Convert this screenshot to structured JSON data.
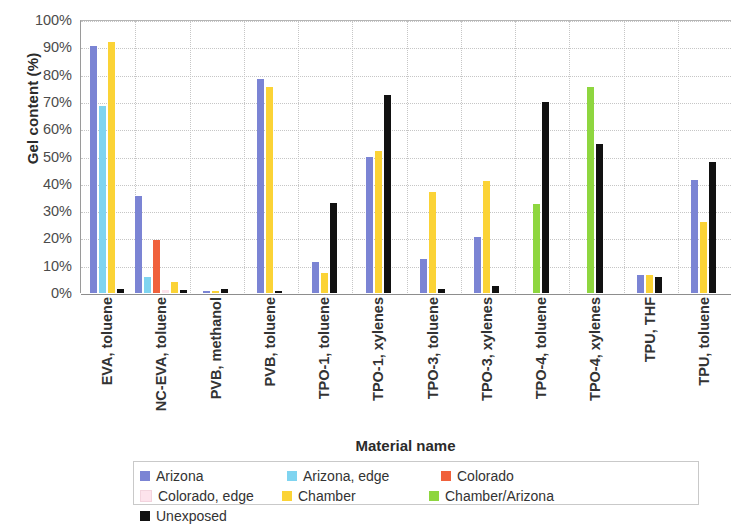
{
  "chart_data": {
    "type": "bar",
    "title": "",
    "xlabel": "Material name",
    "ylabel": "Gel content (%)",
    "ylim": [
      0,
      100
    ],
    "ytick_labels": [
      "100%",
      "90%",
      "80%",
      "70%",
      "60%",
      "50%",
      "40%",
      "30%",
      "20%",
      "10%",
      "0%"
    ],
    "ytick_values": [
      100,
      90,
      80,
      70,
      60,
      50,
      40,
      30,
      20,
      10,
      0
    ],
    "grid": true,
    "legend_position": "bottom",
    "categories": [
      "EVA, toluene",
      "NC-EVA, toluene",
      "PVB, methanol",
      "PVB, toluene",
      "TPO-1, toluene",
      "TPO-1, xylenes",
      "TPO-3, toluene",
      "TPO-3, xylenes",
      "TPO-4, toluene",
      "TPO-4, xylenes",
      "TPU, THF",
      "TPU, toluene"
    ],
    "series": [
      {
        "name": "Arizona",
        "color": "#7b84d4",
        "values": [
          90.5,
          35.5,
          0.8,
          78.5,
          11.5,
          50,
          12.5,
          20.5,
          0,
          0,
          6.5,
          41.5
        ]
      },
      {
        "name": "Arizona, edge",
        "color": "#7fd4f0",
        "values": [
          68.5,
          6,
          0,
          0,
          0,
          0,
          0,
          0,
          0,
          0,
          0,
          0
        ]
      },
      {
        "name": "Colorado",
        "color": "#f0613c",
        "values": [
          0,
          19.5,
          0,
          0,
          0,
          0,
          0,
          0,
          0,
          0,
          0,
          0
        ]
      },
      {
        "name": "Colorado, edge",
        "color": "#fde3ec",
        "values": [
          0,
          1.2,
          0,
          0,
          0,
          0,
          0,
          0,
          0,
          0,
          0,
          0
        ]
      },
      {
        "name": "Chamber",
        "color": "#fbd336",
        "values": [
          92,
          4,
          0.6,
          75.5,
          7.5,
          52,
          37,
          41,
          0,
          0,
          6.5,
          26
        ]
      },
      {
        "name": "Chamber/Arizona",
        "color": "#8ed63f",
        "values": [
          0,
          0,
          0,
          0,
          0,
          0,
          0,
          0,
          32.5,
          75.5,
          0,
          0
        ]
      },
      {
        "name": "Unexposed",
        "color": "#111111",
        "values": [
          1.3,
          1.2,
          1.5,
          0.8,
          33,
          72.5,
          1.5,
          2.5,
          70,
          54.5,
          6,
          48
        ]
      }
    ]
  },
  "legend": {
    "items": [
      {
        "label": "Arizona",
        "color": "#7b84d4"
      },
      {
        "label": "Arizona, edge",
        "color": "#7fd4f0"
      },
      {
        "label": "Colorado",
        "color": "#f0613c"
      },
      {
        "label": "Colorado, edge",
        "color": "#fde3ec"
      },
      {
        "label": "Chamber",
        "color": "#fbd336"
      },
      {
        "label": "Chamber/Arizona",
        "color": "#8ed63f"
      },
      {
        "label": "Unexposed",
        "color": "#111111"
      }
    ]
  },
  "axes": {
    "y_title": "Gel content (%)",
    "x_title": "Material name"
  }
}
